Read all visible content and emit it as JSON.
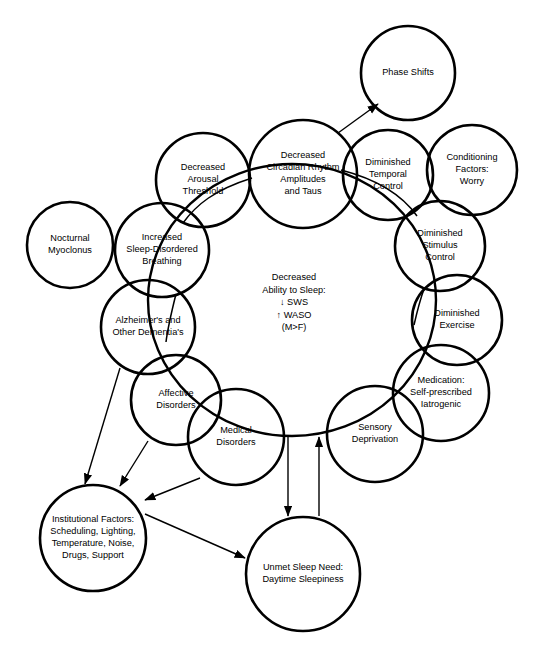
{
  "diagram": {
    "background_color": "#ffffff",
    "stroke_color": "#000000",
    "hub": {
      "name": "decreased-ability-to-sleep",
      "lines": [
        "Decreased",
        "Ability to Sleep:",
        "↓  SWS",
        "↑  WASO",
        "(M>F)"
      ],
      "cx": 294,
      "cy": 303,
      "line_height": 12.5
    },
    "ring": {
      "cx": 292,
      "cy": 300,
      "rx": 144,
      "ry": 136
    },
    "nodes": [
      {
        "id": "phase-shifts",
        "lines": [
          "Phase Shifts"
        ],
        "cx": 408,
        "cy": 73,
        "r": 47
      },
      {
        "id": "decreased-circadian-rhythm",
        "lines": [
          "Decreased",
          "Circadian Rhythm",
          "Amplitudes",
          "and Taus"
        ],
        "cx": 303,
        "cy": 174,
        "r": 54
      },
      {
        "id": "decreased-arousal-threshold",
        "lines": [
          "Decreased",
          "Arousal",
          "Threshold"
        ],
        "cx": 203,
        "cy": 180,
        "r": 47
      },
      {
        "id": "increased-sleep-disordered-breathing",
        "lines": [
          "Increased",
          "Sleep-Disordered",
          "Breathing"
        ],
        "cx": 162,
        "cy": 250,
        "r": 47
      },
      {
        "id": "nocturnal-myoclonus",
        "lines": [
          "Nocturnal",
          "Myoclonus"
        ],
        "cx": 70,
        "cy": 245,
        "r": 43
      },
      {
        "id": "alzheimers-and-other-dementias",
        "lines": [
          "Alzheimer's and",
          "Other Dementia's"
        ],
        "cx": 148,
        "cy": 327,
        "r": 47
      },
      {
        "id": "affective-disorders",
        "lines": [
          "Affective",
          "Disorders"
        ],
        "cx": 176,
        "cy": 400,
        "r": 45
      },
      {
        "id": "medical-disorders",
        "lines": [
          "Medical",
          "Disorders"
        ],
        "cx": 236,
        "cy": 437,
        "r": 48
      },
      {
        "id": "sensory-deprivation",
        "lines": [
          "Sensory",
          "Deprivation"
        ],
        "cx": 375,
        "cy": 434,
        "r": 48
      },
      {
        "id": "medication-self-prescribed",
        "lines": [
          "Medication:",
          "Self-prescribed",
          "Iatrogenic"
        ],
        "cx": 441,
        "cy": 393,
        "r": 48
      },
      {
        "id": "diminished-exercise",
        "lines": [
          "Diminished",
          "Exercise"
        ],
        "cx": 457,
        "cy": 320,
        "r": 45
      },
      {
        "id": "diminished-stimulus-control",
        "lines": [
          "Diminished",
          "Stimulus",
          "Control"
        ],
        "cx": 440,
        "cy": 246,
        "r": 45
      },
      {
        "id": "conditioning-factors-worry",
        "lines": [
          "Conditioning",
          "Factors:",
          "Worry"
        ],
        "cx": 472,
        "cy": 170,
        "r": 45
      },
      {
        "id": "diminished-temporal-control",
        "lines": [
          "Diminished",
          "Temporal",
          "Control"
        ],
        "cx": 388,
        "cy": 175,
        "r": 45
      },
      {
        "id": "institutional-factors",
        "lines": [
          "Institutional Factors:",
          "Scheduling, Lighting,",
          "Temperature, Noise,",
          "Drugs, Support"
        ],
        "cx": 93,
        "cy": 538,
        "r": 53
      },
      {
        "id": "unmet-sleep-need",
        "lines": [
          "Unmet Sleep Need:",
          "Daytime Sleepiness"
        ],
        "cx": 303,
        "cy": 574,
        "r": 57
      }
    ],
    "connectors": [
      {
        "id": "arousal-to-circadian-link",
        "path": "M 183 223 C 196 205 214 190 252 178"
      },
      {
        "id": "circadian-to-temporal-link",
        "path": "M 341 170 C 372 178 400 192 417 216"
      },
      {
        "id": "breathing-to-dementia-link",
        "path": "M 176 294 C 172 310 168 326 166 342"
      },
      {
        "id": "stimulus-to-exercise-link",
        "path": "M 424 289 C 420 300 417 312 414 325"
      }
    ],
    "arrows": [
      {
        "id": "arrow-circadian-to-phase-shifts",
        "path": "M 338 133 L 378 104",
        "label": "Decreased Circadian Rhythm to Phase Shifts"
      },
      {
        "id": "arrow-dementia-to-institutional",
        "path": "M 120 368 L 85 484",
        "label": "Alzheimer's to Institutional Factors"
      },
      {
        "id": "arrow-affective-to-institutional",
        "path": "M 148 441 L 120 486",
        "label": "Affective Disorders to Institutional Factors"
      },
      {
        "id": "arrow-medical-to-institutional",
        "path": "M 200 478 L 145 500",
        "label": "Medical Disorders to Institutional Factors"
      },
      {
        "id": "arrow-institutional-to-unmet",
        "path": "M 145 514 L 245 558",
        "label": "Institutional Factors to Unmet Sleep Need"
      },
      {
        "id": "arrow-ring-to-unmet",
        "path": "M 288 437 L 288 516",
        "label": "Cycle to Unmet Sleep Need"
      },
      {
        "id": "arrow-unmet-to-ring",
        "path": "M 319 516 L 319 437",
        "label": "Unmet Sleep Need to Sensory Deprivation"
      }
    ]
  }
}
